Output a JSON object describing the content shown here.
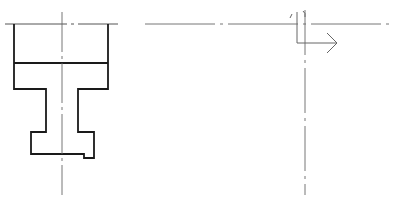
{
  "drawing": {
    "type": "engineering-section-drawing",
    "colors": {
      "outline": "#1a1a1a",
      "thin_line": "#555555",
      "center_line": "#666666",
      "background": "#ffffff"
    },
    "left_view": {
      "description": "Cross-section profile of a stepped part (flange, neck, lower flange)",
      "top_line_y": 24,
      "center_line_x": 62,
      "outline_points": [
        [
          14,
          24
        ],
        [
          14,
          89
        ],
        [
          46,
          89
        ],
        [
          46,
          132
        ],
        [
          31,
          132
        ],
        [
          31,
          154
        ],
        [
          84,
          154
        ],
        [
          84,
          158
        ],
        [
          94,
          158
        ],
        [
          94,
          132
        ],
        [
          78,
          132
        ],
        [
          78,
          89
        ],
        [
          108,
          89
        ],
        [
          108,
          24
        ]
      ],
      "inner_divider_y": 63
    },
    "right_view": {
      "horizontal_center_line": {
        "x1": 145,
        "x2": 392,
        "y": 24
      },
      "vertical_center_line": {
        "x": 305,
        "y1": 8,
        "y2": 195
      },
      "section_arrow": {
        "direction": "right",
        "corner": [
          296,
          43
        ],
        "tip": [
          318,
          43
        ]
      }
    }
  }
}
